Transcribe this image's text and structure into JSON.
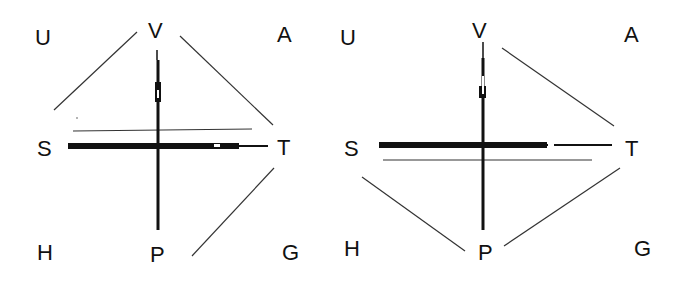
{
  "diagrams": [
    {
      "id": "left",
      "labels": {
        "U": "U",
        "V": "V",
        "A": "A",
        "S": "S",
        "T": "T",
        "H": "H",
        "P": "P",
        "G": "G"
      },
      "connections": [
        "U-V",
        "V-T",
        "T-P",
        "S-T parallel above axis"
      ]
    },
    {
      "id": "right",
      "labels": {
        "U": "U",
        "V": "V",
        "A": "A",
        "S": "S",
        "T": "T",
        "H": "H",
        "P": "P",
        "G": "G"
      },
      "connections": [
        "V-T",
        "S-P",
        "P-T",
        "S-T parallel below axis"
      ]
    }
  ],
  "colors": {
    "ink": "#111111",
    "line": "#333333",
    "background": "#ffffff"
  }
}
